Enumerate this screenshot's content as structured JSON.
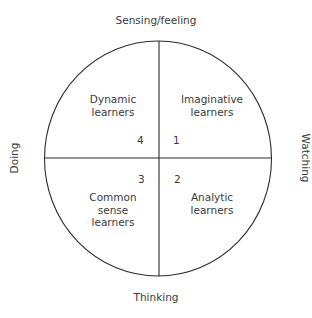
{
  "axes": {
    "top": "Sensing/feeling",
    "bottom": "Thinking",
    "left": "Doing",
    "right": "Watching"
  },
  "quadrants": [
    {
      "number": "1",
      "label_line1": "Imaginative",
      "label_line2": "learners",
      "label_line3": ""
    },
    {
      "number": "2",
      "label_line1": "Analytic",
      "label_line2": "learners",
      "label_line3": ""
    },
    {
      "number": "3",
      "label_line1": "Common",
      "label_line2": "sense",
      "label_line3": "learners"
    },
    {
      "number": "4",
      "label_line1": "Dynamic",
      "label_line2": "learners",
      "label_line3": ""
    }
  ],
  "colors": {
    "stroke": "#2b2b2b",
    "text": "#3a3a3a",
    "background": "#ffffff"
  }
}
